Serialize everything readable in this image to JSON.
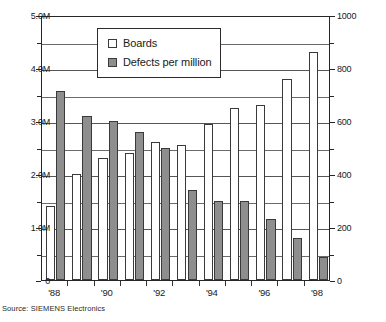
{
  "chart_data": {
    "type": "bar",
    "title": "",
    "subtitle": "",
    "xlabel": "",
    "ylabel": "",
    "grid": true,
    "legend_position": "top-center-inside",
    "categories": [
      "'88",
      "'89",
      "'90",
      "'91",
      "'92",
      "'93",
      "'94",
      "'95",
      "'96",
      "'97",
      "'98"
    ],
    "tick_labels_shown": [
      "'88",
      "'90",
      "'92",
      "'94",
      "'96",
      "'98"
    ],
    "series": [
      {
        "name": "Boards",
        "axis": "left",
        "unit": "M",
        "color": "#ffffff",
        "edge_color": "#3a3a3a",
        "values": [
          1.4,
          2.0,
          2.3,
          2.4,
          2.6,
          2.55,
          2.95,
          3.25,
          3.3,
          3.8,
          4.3
        ]
      },
      {
        "name": "Defects per million",
        "axis": "right",
        "unit": "",
        "color": "#8e8e8e",
        "edge_color": "#3a3a3a",
        "values": [
          715,
          620,
          600,
          560,
          500,
          340,
          300,
          300,
          230,
          160,
          85
        ]
      }
    ],
    "left_axis": {
      "label": "",
      "ylim": [
        0,
        5000000
      ],
      "ticks": [
        0,
        1000000,
        2000000,
        3000000,
        4000000,
        5000000
      ],
      "tick_labels": [
        "0",
        "1.0M",
        "2.0M",
        "3.0M",
        "4.0M",
        "5.0M"
      ],
      "minor_ticks": [
        500000,
        1500000,
        2500000,
        3500000,
        4500000
      ]
    },
    "right_axis": {
      "label": "",
      "ylim": [
        0,
        1000
      ],
      "ticks": [
        0,
        200,
        400,
        600,
        800,
        1000
      ],
      "tick_labels": [
        "0",
        "200",
        "400",
        "600",
        "800",
        "1000"
      ],
      "minor_ticks": [
        100,
        300,
        500,
        700,
        900
      ]
    }
  },
  "legend": {
    "items": [
      {
        "label": "Boards",
        "swatch": "hollow-square-swatch"
      },
      {
        "label": "Defects per million",
        "swatch": "filled-gray-square-swatch"
      }
    ]
  },
  "caption": {
    "source": "Source: SIEMENS Electronics"
  }
}
